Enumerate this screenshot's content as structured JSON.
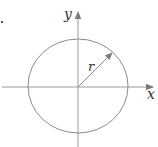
{
  "diagram": {
    "type": "circle-on-axes",
    "labels": {
      "x_axis": "x",
      "y_axis": "y",
      "radius": "r"
    },
    "circle": {
      "center": [
        78,
        87
      ],
      "rx": 50,
      "ry": 47
    },
    "radius_arrow": {
      "from": [
        78,
        87
      ],
      "to": [
        112,
        53
      ]
    },
    "colors": {
      "stroke": "#8a8a8a",
      "label": "#333333"
    }
  }
}
